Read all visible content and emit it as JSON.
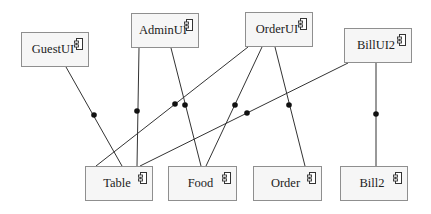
{
  "diagram": {
    "type": "component-diagram",
    "components": [
      {
        "id": "GuestUI",
        "label": "GuestUI",
        "x": 21,
        "y": 32,
        "w": 68,
        "h": 35
      },
      {
        "id": "AdminUI",
        "label": "AdminUI",
        "x": 131,
        "y": 13,
        "w": 68,
        "h": 35
      },
      {
        "id": "OrderUI",
        "label": "OrderUI",
        "x": 245,
        "y": 12,
        "w": 68,
        "h": 35
      },
      {
        "id": "BillUI2",
        "label": "BillUI2",
        "x": 344,
        "y": 28,
        "w": 68,
        "h": 35
      },
      {
        "id": "Table",
        "label": "Table",
        "x": 85,
        "y": 166,
        "w": 68,
        "h": 35
      },
      {
        "id": "Food",
        "label": "Food",
        "x": 168,
        "y": 166,
        "w": 69,
        "h": 35
      },
      {
        "id": "Order",
        "label": "Order",
        "x": 253,
        "y": 166,
        "w": 69,
        "h": 35
      },
      {
        "id": "Bill2",
        "label": "Bill2",
        "x": 340,
        "y": 166,
        "w": 68,
        "h": 35
      }
    ],
    "connections": [
      {
        "from": "GuestUI",
        "to": "Table",
        "x1": 66,
        "y1": 67,
        "x2": 122,
        "y2": 166,
        "dot": [
          94,
          115
        ]
      },
      {
        "from": "AdminUI",
        "to": "Table",
        "x1": 139,
        "y1": 48,
        "x2": 137,
        "y2": 166,
        "dot": [
          137,
          111
        ]
      },
      {
        "from": "AdminUI",
        "to": "Food",
        "x1": 171,
        "y1": 48,
        "x2": 201,
        "y2": 166,
        "dot": [
          185,
          105
        ]
      },
      {
        "from": "OrderUI",
        "to": "Table",
        "x1": 248,
        "y1": 47,
        "x2": 96,
        "y2": 166,
        "dot": [
          175,
          104
        ]
      },
      {
        "from": "OrderUI",
        "to": "Food",
        "x1": 262,
        "y1": 47,
        "x2": 206,
        "y2": 166,
        "dot": [
          235,
          105
        ]
      },
      {
        "from": "OrderUI",
        "to": "Order",
        "x1": 275,
        "y1": 47,
        "x2": 305,
        "y2": 166,
        "dot": [
          289,
          105
        ]
      },
      {
        "from": "BillUI2",
        "to": "Table",
        "x1": 348,
        "y1": 63,
        "x2": 140,
        "y2": 166,
        "dot": [
          247,
          113
        ]
      },
      {
        "from": "BillUI2",
        "to": "Bill2",
        "x1": 376,
        "y1": 63,
        "x2": 376,
        "y2": 166,
        "dot": [
          376,
          114
        ]
      }
    ],
    "colors": {
      "box_fill": "#f6f6f6",
      "box_border": "#8f8f8f",
      "line": "#333333",
      "dot": "#111111"
    }
  }
}
